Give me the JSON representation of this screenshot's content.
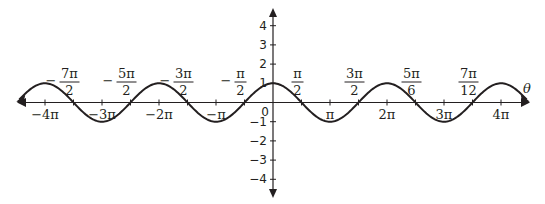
{
  "chart_data": {
    "type": "line",
    "title": "",
    "function": "cos(theta)",
    "xlabel": "θ",
    "ylabel": "",
    "xlim_pi": [
      -4.5,
      4.5
    ],
    "ylim": [
      -4.5,
      4.5
    ],
    "grid": false,
    "series": [
      {
        "name": "y = cos θ",
        "amplitude": 1,
        "period_pi": 2,
        "x_range_pi": [
          -4.45,
          4.45
        ]
      }
    ],
    "x_ticks": [
      {
        "value_pi": -4,
        "label": "−4π"
      },
      {
        "value_pi": -3,
        "label": "−3π"
      },
      {
        "value_pi": -2,
        "label": "−2π"
      },
      {
        "value_pi": -1,
        "label": "−π"
      },
      {
        "value_pi": 1,
        "label": "π"
      },
      {
        "value_pi": 2,
        "label": "2π"
      },
      {
        "value_pi": 3,
        "label": "3π"
      },
      {
        "value_pi": 4,
        "label": "4π"
      }
    ],
    "y_ticks": [
      {
        "value": 4,
        "label": "4"
      },
      {
        "value": 3,
        "label": "3"
      },
      {
        "value": 2,
        "label": "2"
      },
      {
        "value": 1,
        "label": "1"
      },
      {
        "value": -1,
        "label": "−1"
      },
      {
        "value": -2,
        "label": "−2"
      },
      {
        "value": -3,
        "label": "−3"
      },
      {
        "value": -4,
        "label": "−4"
      }
    ],
    "origin_label": "0",
    "annotations": [
      {
        "at_pi": -3.5,
        "sign": "−",
        "numerator": "7π",
        "denominator": "2"
      },
      {
        "at_pi": -2.5,
        "sign": "−",
        "numerator": "5π",
        "denominator": "2"
      },
      {
        "at_pi": -1.5,
        "sign": "−",
        "numerator": "3π",
        "denominator": "2"
      },
      {
        "at_pi": -0.5,
        "sign": "−",
        "numerator": "π",
        "denominator": "2"
      },
      {
        "at_pi": 0.5,
        "sign": "",
        "numerator": "π",
        "denominator": "2"
      },
      {
        "at_pi": 1.5,
        "sign": "",
        "numerator": "3π",
        "denominator": "2"
      },
      {
        "at_pi": 2.5,
        "sign": "",
        "numerator": "5π",
        "denominator": "6"
      },
      {
        "at_pi": 3.5,
        "sign": "",
        "numerator": "7π",
        "denominator": "12"
      }
    ]
  }
}
